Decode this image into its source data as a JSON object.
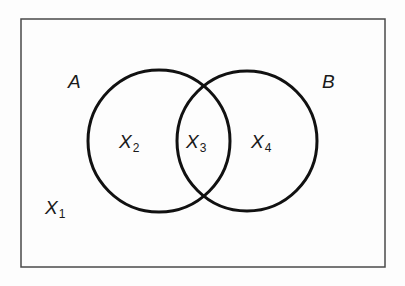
{
  "figure": {
    "type": "venn-diagram",
    "colors": {
      "background": "#fdfdfd",
      "border": "#4a4a4a",
      "circle_stroke": "#111111",
      "label_text": "#1a1a1a"
    },
    "universe": {
      "shape": "rectangle",
      "x": 21,
      "y": 19,
      "width": 364,
      "height": 248,
      "stroke_width": 1.5
    },
    "circles": [
      {
        "id": "A",
        "cx": 159,
        "cy": 141,
        "r": 71,
        "stroke_width": 3
      },
      {
        "id": "B",
        "cx": 247,
        "cy": 141,
        "r": 70,
        "stroke_width": 3
      }
    ],
    "set_labels": {
      "a": "A",
      "b": "B"
    },
    "regions": [
      {
        "id": "X1",
        "base": "X",
        "subscript": "1",
        "meaning": "outside both circles"
      },
      {
        "id": "X2",
        "base": "X",
        "subscript": "2",
        "meaning": "inside A only"
      },
      {
        "id": "X3",
        "base": "X",
        "subscript": "3",
        "meaning": "intersection of A and B"
      },
      {
        "id": "X4",
        "base": "X",
        "subscript": "4",
        "meaning": "inside B only"
      }
    ]
  }
}
